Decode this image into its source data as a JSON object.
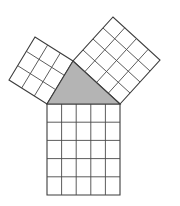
{
  "figure": {
    "title": "Pythagorean theorem figure",
    "background_color": "#ffffff",
    "stroke_color": "#3c3c3c",
    "grid_stroke_color": "#4a4a4a",
    "triangle_fill_color": "#b4b4b4",
    "square_fill_color": "#ffffff",
    "outline_width": 1.1,
    "grid_width": 0.9
  },
  "chart_data": {
    "type": "diagram",
    "title": "Pythagorean theorem figure",
    "subtitle": "",
    "xlabel": "",
    "ylabel": "",
    "grid": true,
    "legend": [],
    "annotations": [],
    "triangle": {
      "name": "right-triangle",
      "fill": "#b4b4b4",
      "vertices": [
        {
          "label": "A",
          "x": 47,
          "y": 104
        },
        {
          "label": "B",
          "x": 120,
          "y": 104
        },
        {
          "label": "C",
          "x": 73,
          "y": 61
        }
      ],
      "side_lengths_units": {
        "leg_a": 3,
        "leg_b": 4,
        "hypotenuse_c": 5
      },
      "right_angle_at": "C"
    },
    "squares": [
      {
        "name": "square-on-hypotenuse",
        "side_units": 5,
        "cells": 25,
        "position": "bottom",
        "base_edge": [
          "A",
          "B"
        ],
        "corners": [
          {
            "x": 47,
            "y": 104
          },
          {
            "x": 120,
            "y": 104
          },
          {
            "x": 120,
            "y": 195
          },
          {
            "x": 47,
            "y": 195
          }
        ]
      },
      {
        "name": "square-on-short-leg",
        "side_units": 3,
        "cells": 9,
        "position": "upper-left",
        "base_edge": [
          "C",
          "A"
        ],
        "corners": [
          {
            "x": 73,
            "y": 61
          },
          {
            "x": 47,
            "y": 104
          },
          {
            "x": 9,
            "y": 80
          },
          {
            "x": 35,
            "y": 37
          }
        ]
      },
      {
        "name": "square-on-long-leg",
        "side_units": 4,
        "cells": 16,
        "position": "upper-right",
        "base_edge": [
          "B",
          "C"
        ],
        "corners": [
          {
            "x": 120,
            "y": 104
          },
          {
            "x": 73,
            "y": 61
          },
          {
            "x": 113,
            "y": 17
          },
          {
            "x": 160,
            "y": 60
          }
        ]
      }
    ],
    "relation": "3^2 + 4^2 = 5^2",
    "values": [
      9,
      16,
      25
    ],
    "categories": [
      "leg a squared",
      "leg b squared",
      "hypotenuse squared"
    ]
  }
}
